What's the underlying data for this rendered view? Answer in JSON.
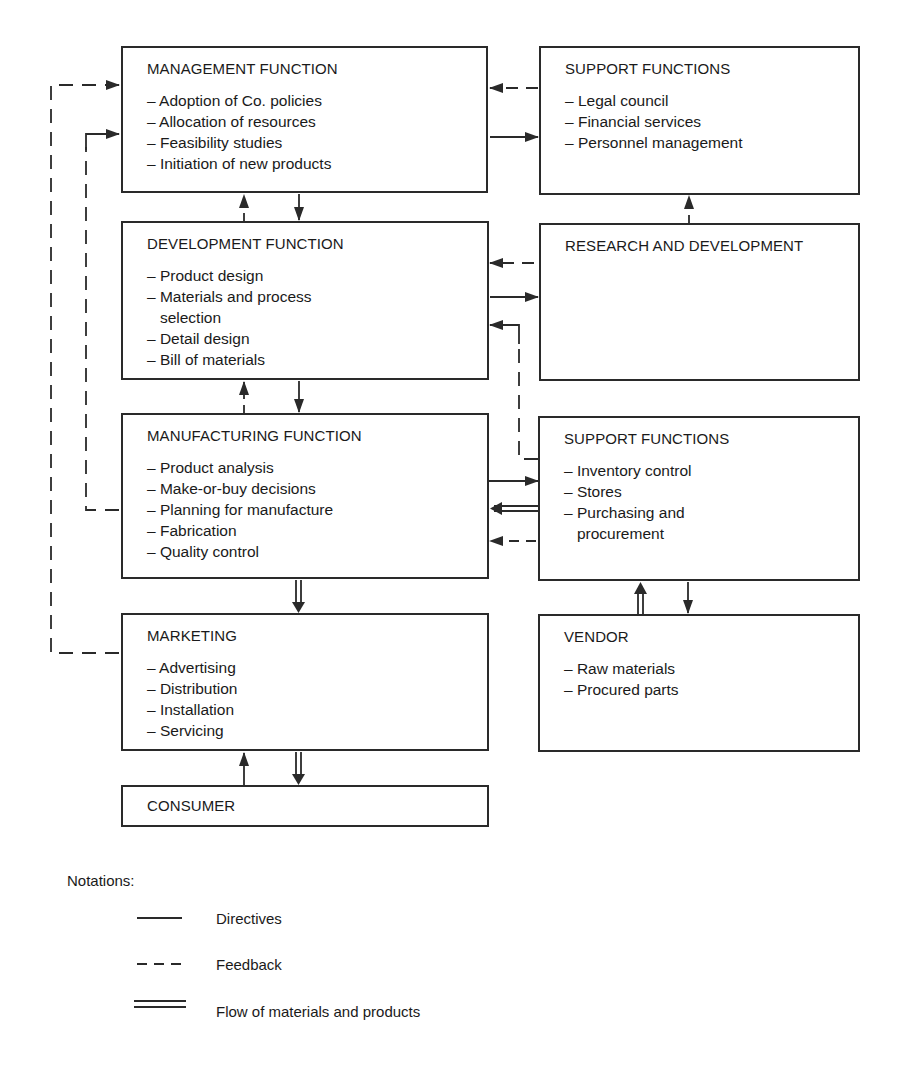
{
  "title": "",
  "boxes": {
    "management": {
      "title": "MANAGEMENT FUNCTION",
      "items": [
        "– Adoption of Co. policies",
        "– Allocation of resources",
        "– Feasibility studies",
        "– Initiation of new products"
      ]
    },
    "support_top": {
      "title": "SUPPORT FUNCTIONS",
      "items": [
        "– Legal council",
        "– Financial services",
        "– Personnel management"
      ]
    },
    "development": {
      "title": "DEVELOPMENT FUNCTION",
      "items": [
        "– Product design",
        "– Materials and process",
        "   selection",
        "– Detail design",
        "– Bill of materials"
      ]
    },
    "research": {
      "title": "RESEARCH AND DEVELOPMENT",
      "items": []
    },
    "manufacturing": {
      "title": "MANUFACTURING FUNCTION",
      "items": [
        "– Product analysis",
        "– Make-or-buy decisions",
        "– Planning for manufacture",
        "– Fabrication",
        "– Quality control"
      ]
    },
    "support_mid": {
      "title": "SUPPORT FUNCTIONS",
      "items": [
        "– Inventory control",
        "– Stores",
        "– Purchasing and",
        "   procurement"
      ]
    },
    "marketing": {
      "title": "MARKETING",
      "items": [
        "– Advertising",
        "– Distribution",
        "– Installation",
        "– Servicing"
      ]
    },
    "vendor": {
      "title": "VENDOR",
      "items": [
        "– Raw materials",
        "– Procured parts"
      ]
    },
    "consumer": {
      "title": "CONSUMER",
      "items": []
    }
  },
  "legend": {
    "title": "Notations:",
    "entries": [
      {
        "style": "solid",
        "label": "Directives"
      },
      {
        "style": "dashed",
        "label": "Feedback"
      },
      {
        "style": "double",
        "label": "Flow of materials and products"
      }
    ]
  },
  "colors": {
    "line": "#2a2a2a",
    "background": "#ffffff"
  }
}
